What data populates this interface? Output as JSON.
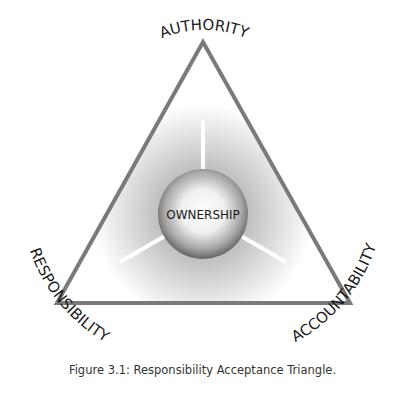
{
  "diagram": {
    "title": "Responsibility Acceptance Triangle",
    "center_label": "OWNERSHIP",
    "vertices": {
      "top": "AUTHORITY",
      "bottom_left": "RESPONSIBILITY",
      "bottom_right": "ACCOUNTABILITY"
    },
    "colors": {
      "triangle_stroke": "#7a7a7a",
      "text": "#1a1a1a",
      "sphere_dark": "#6e6e6e",
      "sphere_light": "#ffffff"
    }
  },
  "caption": "Figure 3.1: Responsibility Acceptance Triangle."
}
